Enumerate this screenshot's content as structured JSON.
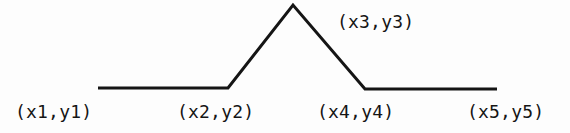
{
  "figure": {
    "background_color": "#fdfdfd",
    "stroke_color": "#151515",
    "stroke_width": 3,
    "width": 570,
    "height": 133,
    "labels": [
      {
        "id": "p1",
        "text": "(x1,y1)"
      },
      {
        "id": "p2",
        "text": "(x2,y2)"
      },
      {
        "id": "p3",
        "text": "(x3,y3)"
      },
      {
        "id": "p4",
        "text": "(x4,y4)"
      },
      {
        "id": "p5",
        "text": "(x5,y5)"
      }
    ]
  },
  "chart_data": {
    "type": "line",
    "title": "",
    "xlabel": "",
    "ylabel": "",
    "grid": false,
    "legend": "none",
    "series": [
      {
        "name": "polyline",
        "points": [
          {
            "label": "(x1,y1)",
            "x": 98,
            "y": 88
          },
          {
            "label": "(x2,y2)",
            "x": 228,
            "y": 88
          },
          {
            "label": "(x3,y3)",
            "x": 293,
            "y": 5
          },
          {
            "label": "(x4,y4)",
            "x": 365,
            "y": 89
          },
          {
            "label": "(x5,y5)",
            "x": 497,
            "y": 89
          }
        ]
      }
    ],
    "x": [
      98,
      228,
      293,
      365,
      497
    ],
    "values": [
      88,
      88,
      5,
      89,
      89
    ],
    "xlim": [
      0,
      570
    ],
    "ylim": [
      133,
      0
    ],
    "annotations": [
      {
        "text": "(x1,y1)",
        "x": 15,
        "y": 102
      },
      {
        "text": "(x2,y2)",
        "x": 177,
        "y": 102
      },
      {
        "text": "(x3,y3)",
        "x": 337,
        "y": 12
      },
      {
        "text": "(x4,y4)",
        "x": 317,
        "y": 102
      },
      {
        "text": "(x5,y5)",
        "x": 467,
        "y": 102
      }
    ]
  }
}
